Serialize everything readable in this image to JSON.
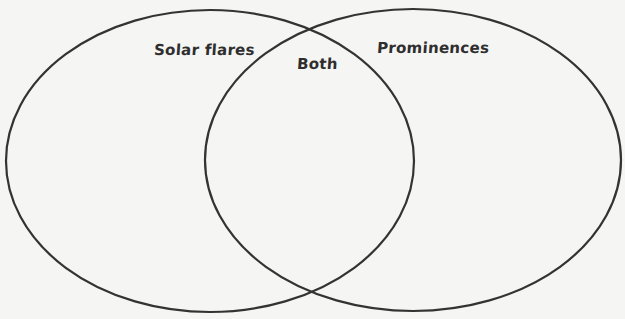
{
  "diagram": {
    "type": "venn",
    "stroke_color": "#333333",
    "background_color": "#f5f5f3",
    "sets": [
      {
        "id": "left",
        "label": "Solar flares",
        "shape": {
          "cx": 210,
          "cy": 161,
          "rx": 204,
          "ry": 151
        }
      },
      {
        "id": "right",
        "label": "Prominences",
        "shape": {
          "cx": 413,
          "cy": 160,
          "rx": 208,
          "ry": 151
        }
      }
    ],
    "intersection": {
      "label": "Both"
    }
  }
}
